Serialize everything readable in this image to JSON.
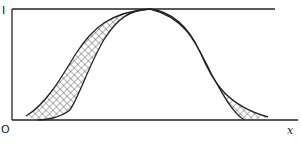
{
  "figure": {
    "labels": {
      "y_top": "I",
      "origin": "O",
      "x_axis": "x"
    },
    "colors": {
      "line": "#222222",
      "hatch": "#444444",
      "background": "#ffffff"
    },
    "curves": [
      {
        "name": "wide-bell",
        "description": "broader bell-shaped curve peaking at 1"
      },
      {
        "name": "narrow-bell",
        "description": "narrower bell-shaped curve peaking at 1"
      }
    ],
    "shaded_region": "cross-hatched band between the two curves"
  }
}
